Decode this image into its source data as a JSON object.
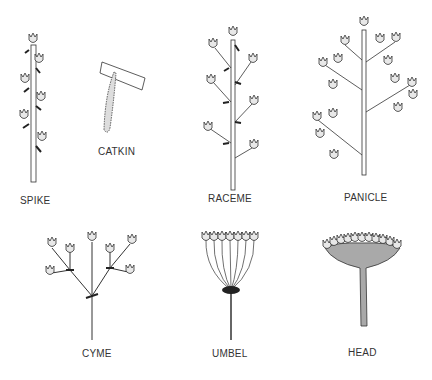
{
  "diagram": {
    "labels": {
      "spike": "SPIKE",
      "catkin": "CATKIN",
      "raceme": "RACEME",
      "panicle": "PANICLE",
      "cyme": "CYME",
      "umbel": "UMBEL",
      "head": "HEAD"
    },
    "colors": {
      "stroke": "#333333",
      "flower_fill": "#e8e8e8",
      "head_fill": "#a9a9a9",
      "leaf": "#222222"
    }
  }
}
